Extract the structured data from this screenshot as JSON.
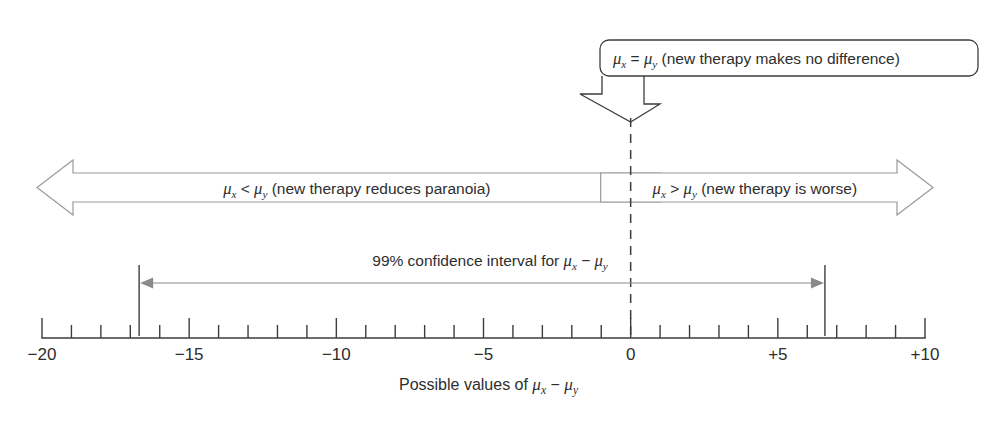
{
  "figure": {
    "caption": "Possible values of",
    "caption_expr_parts": {
      "mu": "μ",
      "x": "x",
      "op": "−",
      "y": "y"
    }
  },
  "callout": {
    "text_prefix": "",
    "mu": "μ",
    "sub_x": "x",
    "relation": "=",
    "sub_y": "y",
    "description": "(new therapy makes no difference)",
    "full_text": "μx = μy (new therapy makes no difference)",
    "points_to_value": 0
  },
  "bands": [
    {
      "name": "left-band",
      "direction": "left",
      "mu": "μ",
      "sub_x": "x",
      "relation": "<",
      "sub_y": "y",
      "description": "(new therapy reduces paranoia)",
      "full_text": "μx < μy (new therapy reduces paranoia)"
    },
    {
      "name": "right-band",
      "direction": "right",
      "mu": "μ",
      "sub_x": "x",
      "relation": ">",
      "sub_y": "y",
      "description": "(new therapy is worse)",
      "full_text": "μx > μy (new therapy is worse)"
    }
  ],
  "confidence_interval": {
    "label_prefix": "99% confidence interval for",
    "mu": "μ",
    "sub_x": "x",
    "op": "−",
    "sub_y": "y",
    "full_text": "99% confidence interval for μx − μy",
    "level": "99%",
    "lower": -16.7,
    "upper": 6.6,
    "includes_zero": true
  },
  "chart_data": {
    "type": "line",
    "title": "99% confidence interval for μx − μy",
    "xlabel": "Possible values of μx − μy",
    "ylabel": "",
    "xlim": [
      -20,
      10
    ],
    "grid": false,
    "legend": "none",
    "major_tick_interval": 5,
    "minor_tick_interval": 1,
    "tick_labels": [
      "−20",
      "−15",
      "−10",
      "−5",
      "0",
      "+5",
      "+10"
    ],
    "tick_values": [
      -20,
      -15,
      -10,
      -5,
      0,
      5,
      10
    ],
    "annotations": [
      {
        "name": "null-hypothesis",
        "at": 0,
        "text": "μx = μy (new therapy makes no difference)"
      },
      {
        "name": "left-region",
        "range": [
          -20,
          0
        ],
        "text": "μx < μy (new therapy reduces paranoia)"
      },
      {
        "name": "right-region",
        "range": [
          0,
          10
        ],
        "text": "μx > μy (new therapy is worse)"
      }
    ],
    "series": [
      {
        "name": "99% confidence interval",
        "type": "interval",
        "lower": -16.7,
        "upper": 6.6,
        "values": [
          -16.7,
          6.6
        ]
      }
    ]
  },
  "axis": {
    "labels": [
      {
        "value": -20,
        "text": "−20"
      },
      {
        "value": -15,
        "text": "−15"
      },
      {
        "value": -10,
        "text": "−10"
      },
      {
        "value": -5,
        "text": "−5"
      },
      {
        "value": 0,
        "text": "0"
      },
      {
        "value": 5,
        "text": "+5"
      },
      {
        "value": 10,
        "text": "+10"
      }
    ]
  },
  "geometry": {
    "x_min": -20,
    "x_max": 10,
    "px_left": 42,
    "px_right": 925,
    "axis_y": 338,
    "tick_minor_len": 13,
    "tick_major_len": 20,
    "band_top": 160,
    "band_bottom": 215,
    "ci_line_y": 283,
    "ci_cap_top": 265,
    "ci_cap_bottom": 336,
    "callout_box": {
      "x": 600,
      "y": 40,
      "w": 378,
      "h": 36,
      "rx": 9
    },
    "callout_arrow_tip_y": 122,
    "center_dash_top": 118
  }
}
